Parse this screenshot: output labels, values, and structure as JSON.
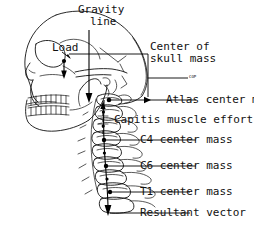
{
  "figure": {
    "background_color": "#ffffff",
    "ink_color": "#111111"
  },
  "labels": {
    "gravity_line_1": "Gravity",
    "gravity_line_2": "line",
    "load": "Load",
    "center_of_1": "Center of",
    "center_of_2": "skull mass",
    "cop": "COP",
    "atlas_center_mass": "Atlas center mass",
    "capitis_muscle_effort": "Capitis muscle effort",
    "c4_center_mass": "C4 center mass",
    "c6_center_mass": "C6 center mass",
    "t1_center_mass": "T1 center mass",
    "resultant_vector": "Resultant vector"
  },
  "icons": {
    "skull": "skull-lateral-icon",
    "mandible": "mandible-icon",
    "teeth": "teeth-icon",
    "cervical_spine": "cervical-spine-icon",
    "gravity_arrow": "down-arrow-icon",
    "load_arrow": "down-arrow-icon",
    "resultant_arrow": "down-arrow-icon",
    "atlas_arrow": "right-arrow-icon",
    "leader_line": "leader-line-icon",
    "mass_point": "mass-point-dot-icon"
  },
  "annotations": {
    "vectors": [
      {
        "name": "gravity-line",
        "direction": "down",
        "label": "Gravity line"
      },
      {
        "name": "load-vector",
        "direction": "down",
        "label": "Load"
      },
      {
        "name": "resultant-vector",
        "direction": "down",
        "label": "Resultant vector"
      }
    ],
    "mass_points": [
      {
        "name": "center-of-skull-mass",
        "label": "Center of skull mass"
      },
      {
        "name": "atlas-center-mass",
        "label": "Atlas center mass"
      },
      {
        "name": "c4-center-mass",
        "label": "C4 center mass"
      },
      {
        "name": "c6-center-mass",
        "label": "C6 center mass"
      },
      {
        "name": "t1-center-mass",
        "label": "T1 center mass"
      }
    ],
    "forces": [
      {
        "name": "capitis-muscle-effort",
        "label": "Capitis muscle effort"
      }
    ],
    "reference_points": [
      {
        "name": "cop",
        "label": "COP"
      }
    ]
  }
}
